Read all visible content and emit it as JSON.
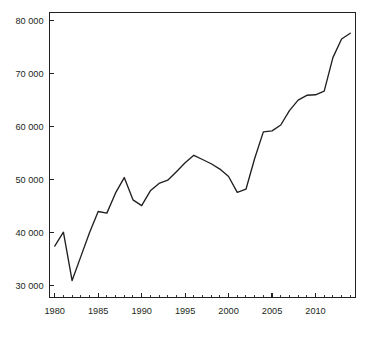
{
  "chart_data": {
    "type": "line",
    "title": "",
    "subtitle": "",
    "xlabel": "",
    "ylabel": "",
    "xlim": [
      1979.4,
      2014.6
    ],
    "ylim": [
      27800,
      81500
    ],
    "grid": false,
    "legend": null,
    "x_tick_labels": [
      "1980",
      "1985",
      "1990",
      "1995",
      "2000",
      "2005",
      "2010"
    ],
    "x_tick_values": [
      1980,
      1985,
      1990,
      1995,
      2000,
      2005,
      2010
    ],
    "x_minor_tick_step": 1,
    "y_tick_labels": [
      "30 000",
      "40 000",
      "50 000",
      "60 000",
      "70 000",
      "80 000"
    ],
    "y_tick_values": [
      30000,
      40000,
      50000,
      60000,
      70000,
      80000
    ],
    "line_color": "#231f20",
    "axis_color": "#231f20",
    "background_color": "#ffffff",
    "x": [
      1980,
      1981,
      1982,
      1983,
      1984,
      1985,
      1986,
      1987,
      1988,
      1989,
      1990,
      1991,
      1992,
      1993,
      1994,
      1995,
      1996,
      1997,
      1998,
      1999,
      2000,
      2001,
      2002,
      2003,
      2004,
      2005,
      2006,
      2007,
      2008,
      2009,
      2010,
      2011,
      2012,
      2013,
      2014
    ],
    "series": [
      {
        "name": "value",
        "values": [
          37500,
          40100,
          31000,
          35500,
          40000,
          44000,
          43700,
          47500,
          50400,
          46200,
          45100,
          47900,
          49300,
          49900,
          51500,
          53200,
          54600,
          53800,
          53000,
          52000,
          50600,
          47600,
          48200,
          54000,
          59000,
          59200,
          60300,
          63000,
          65000,
          65900,
          66000,
          66700,
          73000,
          76500,
          77600
        ]
      }
    ]
  }
}
